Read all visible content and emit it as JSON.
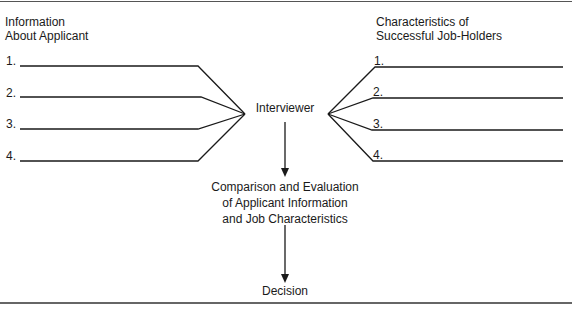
{
  "diagram": {
    "left_column": {
      "heading_lines": [
        "Information",
        "About Applicant"
      ],
      "items": [
        {
          "number": "1.",
          "y": 66
        },
        {
          "number": "2.",
          "y": 97
        },
        {
          "number": "3.",
          "y": 128
        },
        {
          "number": "4.",
          "y": 160
        }
      ]
    },
    "right_column": {
      "heading_lines": [
        "Characteristics of",
        "Successful Job-Holders"
      ],
      "items": [
        {
          "number": "1.",
          "y": 66
        },
        {
          "number": "2.",
          "y": 97
        },
        {
          "number": "3.",
          "y": 128
        },
        {
          "number": "4.",
          "y": 160
        }
      ]
    },
    "center": {
      "node_1": "Interviewer",
      "node_2_lines": [
        "Comparison and Evaluation",
        "of Applicant Information",
        "and Job Characteristics"
      ],
      "node_3": "Decision"
    },
    "colors": {
      "line": "#1a1a1a",
      "text": "#1a1a1a",
      "background": "#ffffff"
    }
  }
}
